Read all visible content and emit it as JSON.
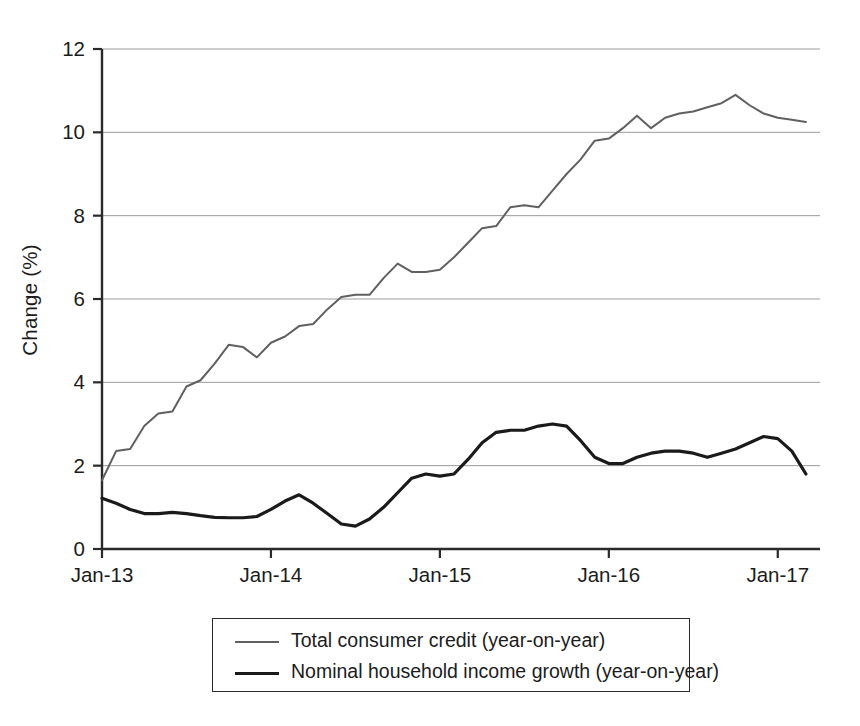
{
  "chart_data": {
    "type": "line",
    "title": "",
    "xlabel": "",
    "ylabel": "Change (%)",
    "ylim": [
      0,
      12
    ],
    "yticks": [
      0,
      2,
      4,
      6,
      8,
      10,
      12
    ],
    "ytick_labels": [
      "0",
      "2",
      "4",
      "6",
      "8",
      "10",
      "12"
    ],
    "xtick_labels": [
      "Jan-13",
      "Jan-14",
      "Jan-15",
      "Jan-16",
      "Jan-17"
    ],
    "xtick_values": [
      0,
      12,
      24,
      36,
      48
    ],
    "xlim": [
      0,
      51
    ],
    "grid": "horizontal",
    "legend_position": "below-plot",
    "series": [
      {
        "name": "Total consumer credit (year-on-year)",
        "color": "#606060",
        "width": 2.0,
        "values": [
          1.65,
          2.35,
          2.4,
          2.95,
          3.25,
          3.3,
          3.9,
          4.05,
          4.45,
          4.9,
          4.85,
          4.6,
          4.95,
          5.1,
          5.35,
          5.4,
          5.75,
          6.05,
          6.1,
          6.1,
          6.5,
          6.85,
          6.65,
          6.65,
          6.7,
          7.0,
          7.35,
          7.7,
          7.75,
          8.2,
          8.25,
          8.2,
          8.6,
          9.0,
          9.35,
          9.8,
          9.85,
          10.1,
          10.4,
          10.1,
          10.35,
          10.45,
          10.5,
          10.6,
          10.7,
          10.9,
          10.65,
          10.45,
          10.35,
          10.3,
          10.25
        ]
      },
      {
        "name": "Nominal household income growth (year-on-year)",
        "color": "#1a1a1a",
        "width": 3.2,
        "values": [
          1.22,
          1.1,
          0.95,
          0.85,
          0.85,
          0.88,
          0.85,
          0.8,
          0.76,
          0.75,
          0.75,
          0.78,
          0.95,
          1.15,
          1.3,
          1.1,
          0.85,
          0.6,
          0.55,
          0.72,
          1.0,
          1.35,
          1.7,
          1.8,
          1.75,
          1.8,
          2.15,
          2.55,
          2.8,
          2.85,
          2.85,
          2.95,
          3.0,
          2.95,
          2.6,
          2.2,
          2.05,
          2.05,
          2.2,
          2.3,
          2.35,
          2.35,
          2.3,
          2.2,
          2.3,
          2.4,
          2.55,
          2.7,
          2.65,
          2.35,
          1.8
        ]
      }
    ]
  },
  "legend": {
    "items": [
      {
        "label": "Total consumer credit (year-on-year)"
      },
      {
        "label": "Nominal household income growth (year-on-year)"
      }
    ]
  },
  "axis": {
    "y_title": "Change (%)"
  }
}
